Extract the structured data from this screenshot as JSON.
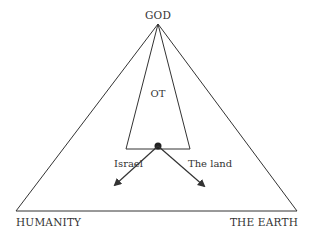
{
  "diagram": {
    "labels": {
      "top": "GOD",
      "bottom_left": "HUMANITY",
      "bottom_right": "THE EARTH",
      "inner": "OT",
      "arrow_left": "Israel",
      "arrow_right": "The land"
    },
    "colors": {
      "stroke": "#333333",
      "text": "#333333",
      "background": "#ffffff"
    },
    "nodes": [
      {
        "id": "god",
        "label": "GOD"
      },
      {
        "id": "humanity",
        "label": "HUMANITY"
      },
      {
        "id": "earth",
        "label": "THE EARTH"
      },
      {
        "id": "ot",
        "label": "OT"
      },
      {
        "id": "israel",
        "label": "Israel"
      },
      {
        "id": "land",
        "label": "The land"
      }
    ],
    "edges": [
      {
        "from": "god",
        "to": "humanity",
        "type": "line"
      },
      {
        "from": "god",
        "to": "earth",
        "type": "line"
      },
      {
        "from": "humanity",
        "to": "earth",
        "type": "line"
      },
      {
        "from": "ot",
        "to": "israel",
        "type": "arrow"
      },
      {
        "from": "ot",
        "to": "land",
        "type": "arrow"
      }
    ]
  }
}
